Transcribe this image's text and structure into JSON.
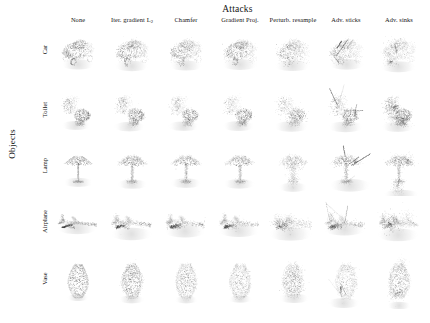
{
  "figure": {
    "column_group_title": "Attacks",
    "row_group_label": "Objects",
    "background_color": "#ffffff",
    "point_color": "#4a4a4a",
    "width": 430,
    "height": 323
  },
  "columns": [
    {
      "label": "None",
      "sub": ""
    },
    {
      "label": "Iter. gradient L",
      "sub": "2"
    },
    {
      "label": "Chamfer",
      "sub": ""
    },
    {
      "label": "Gradient Proj.",
      "sub": ""
    },
    {
      "label": "Perturb. resample",
      "sub": ""
    },
    {
      "label": "Adv. sticks",
      "sub": ""
    },
    {
      "label": "Adv. sinks",
      "sub": ""
    }
  ],
  "rows": [
    {
      "label": "Car"
    },
    {
      "label": "Toilet"
    },
    {
      "label": "Lamp"
    },
    {
      "label": "Airplane"
    },
    {
      "label": "Vase"
    }
  ],
  "chart_data": {
    "type": "scatter",
    "title": "Attacks",
    "xlabel": "Attacks",
    "ylabel": "Objects",
    "grid": false,
    "legend": "none",
    "categories": [
      "None",
      "Iter. gradient L2",
      "Chamfer",
      "Gradient Proj.",
      "Perturb. resample",
      "Adv. sticks",
      "Adv. sinks"
    ],
    "series": [
      {
        "name": "Car",
        "values": [
          1,
          1,
          1,
          1,
          1,
          1,
          1
        ]
      },
      {
        "name": "Toilet",
        "values": [
          1,
          1,
          1,
          1,
          1,
          1,
          1
        ]
      },
      {
        "name": "Lamp",
        "values": [
          1,
          1,
          1,
          1,
          1,
          1,
          1
        ]
      },
      {
        "name": "Airplane",
        "values": [
          1,
          1,
          1,
          1,
          1,
          1,
          1
        ]
      },
      {
        "name": "Vase",
        "values": [
          1,
          1,
          1,
          1,
          1,
          1,
          1
        ]
      }
    ],
    "cells": [
      {
        "row": "Car",
        "col": "None",
        "shape": "car",
        "attack": "none",
        "n": 1100
      },
      {
        "row": "Car",
        "col": "Iter. gradient L2",
        "shape": "car",
        "attack": "jitter",
        "n": 1100
      },
      {
        "row": "Car",
        "col": "Chamfer",
        "shape": "car",
        "attack": "jitter",
        "n": 1100
      },
      {
        "row": "Car",
        "col": "Gradient Proj.",
        "shape": "car",
        "attack": "jitter",
        "n": 1100
      },
      {
        "row": "Car",
        "col": "Perturb. resample",
        "shape": "car",
        "attack": "clump",
        "n": 1000
      },
      {
        "row": "Car",
        "col": "Adv. sticks",
        "shape": "car",
        "attack": "sticks",
        "n": 900
      },
      {
        "row": "Car",
        "col": "Adv. sinks",
        "shape": "car",
        "attack": "sinks",
        "n": 950
      },
      {
        "row": "Toilet",
        "col": "None",
        "shape": "toilet",
        "attack": "none",
        "n": 1000
      },
      {
        "row": "Toilet",
        "col": "Iter. gradient L2",
        "shape": "toilet",
        "attack": "jitter",
        "n": 1000
      },
      {
        "row": "Toilet",
        "col": "Chamfer",
        "shape": "toilet",
        "attack": "jitter",
        "n": 1000
      },
      {
        "row": "Toilet",
        "col": "Gradient Proj.",
        "shape": "toilet",
        "attack": "jitter",
        "n": 1000
      },
      {
        "row": "Toilet",
        "col": "Perturb. resample",
        "shape": "toilet",
        "attack": "clump",
        "n": 950
      },
      {
        "row": "Toilet",
        "col": "Adv. sticks",
        "shape": "toilet",
        "attack": "sticks",
        "n": 850
      },
      {
        "row": "Toilet",
        "col": "Adv. sinks",
        "shape": "toilet",
        "attack": "sinks",
        "n": 900
      },
      {
        "row": "Lamp",
        "col": "None",
        "shape": "lamp",
        "attack": "none",
        "n": 1000
      },
      {
        "row": "Lamp",
        "col": "Iter. gradient L2",
        "shape": "lamp",
        "attack": "jitter",
        "n": 1000
      },
      {
        "row": "Lamp",
        "col": "Chamfer",
        "shape": "lamp",
        "attack": "jitter",
        "n": 1000
      },
      {
        "row": "Lamp",
        "col": "Gradient Proj.",
        "shape": "lamp",
        "attack": "jitter",
        "n": 1000
      },
      {
        "row": "Lamp",
        "col": "Perturb. resample",
        "shape": "lamp",
        "attack": "clump",
        "n": 950
      },
      {
        "row": "Lamp",
        "col": "Adv. sticks",
        "shape": "lamp",
        "attack": "sticks",
        "n": 850
      },
      {
        "row": "Lamp",
        "col": "Adv. sinks",
        "shape": "lamp",
        "attack": "sinks",
        "n": 900
      },
      {
        "row": "Airplane",
        "col": "None",
        "shape": "airplane",
        "attack": "none",
        "n": 1000
      },
      {
        "row": "Airplane",
        "col": "Iter. gradient L2",
        "shape": "airplane",
        "attack": "jitter",
        "n": 1000
      },
      {
        "row": "Airplane",
        "col": "Chamfer",
        "shape": "airplane",
        "attack": "jitter",
        "n": 1000
      },
      {
        "row": "Airplane",
        "col": "Gradient Proj.",
        "shape": "airplane",
        "attack": "jitter",
        "n": 1000
      },
      {
        "row": "Airplane",
        "col": "Perturb. resample",
        "shape": "airplane",
        "attack": "clump",
        "n": 950
      },
      {
        "row": "Airplane",
        "col": "Adv. sticks",
        "shape": "airplane",
        "attack": "sticks",
        "n": 850
      },
      {
        "row": "Airplane",
        "col": "Adv. sinks",
        "shape": "airplane",
        "attack": "sinks",
        "n": 900
      },
      {
        "row": "Vase",
        "col": "None",
        "shape": "vase",
        "attack": "none",
        "n": 1200
      },
      {
        "row": "Vase",
        "col": "Iter. gradient L2",
        "shape": "vase",
        "attack": "jitter",
        "n": 1200
      },
      {
        "row": "Vase",
        "col": "Chamfer",
        "shape": "vase",
        "attack": "jitter",
        "n": 1200
      },
      {
        "row": "Vase",
        "col": "Gradient Proj.",
        "shape": "vase",
        "attack": "jitter",
        "n": 1200
      },
      {
        "row": "Vase",
        "col": "Perturb. resample",
        "shape": "vase",
        "attack": "clump",
        "n": 1100
      },
      {
        "row": "Vase",
        "col": "Adv. sticks",
        "shape": "vase",
        "attack": "sticks",
        "n": 1000
      },
      {
        "row": "Vase",
        "col": "Adv. sinks",
        "shape": "vase",
        "attack": "sinks",
        "n": 1050
      }
    ]
  },
  "layout": {
    "col_centers": [
      78,
      132,
      186,
      240,
      293,
      346,
      399
    ],
    "row_centers": [
      52,
      112,
      168,
      224,
      281
    ],
    "cell_width": 52,
    "cell_height": 56
  }
}
